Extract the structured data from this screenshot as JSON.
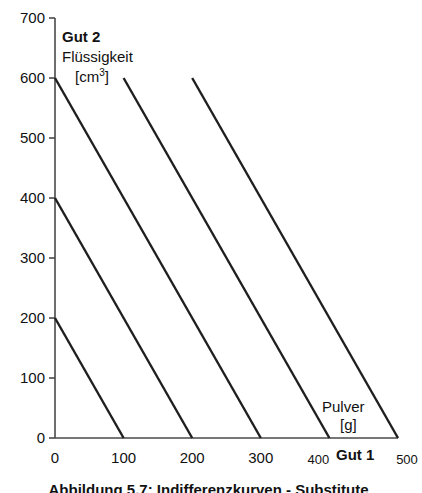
{
  "figure": {
    "background_color": "#ffffff",
    "line_color": "#1f1f1f",
    "axis_color": "#4a4a4a"
  },
  "annotations": {
    "y_axis_name": "Gut 2",
    "y_axis_quantity": "Flüssigkeit",
    "y_axis_unit_prefix": "[cm",
    "y_axis_unit_exponent": "3",
    "y_axis_unit_suffix": "]",
    "x_axis_name": "Gut 1",
    "x_axis_quantity": "Pulver",
    "x_axis_unit": "[g]"
  },
  "caption": "Abbildung 5.7: Indifferenzkurven - Substitute",
  "chart_data": {
    "type": "line",
    "title": "",
    "subtitle": "",
    "xlabel": "Gut 1 / Pulver [g]",
    "ylabel": "Gut 2 / Flüssigkeit [cm3]",
    "xlim": [
      0,
      500
    ],
    "ylim": [
      0,
      700
    ],
    "xticks": [
      0,
      100,
      200,
      300,
      400,
      500
    ],
    "yticks": [
      0,
      100,
      200,
      300,
      400,
      500,
      600,
      700
    ],
    "xtick_labels": [
      "0",
      "100",
      "200",
      "300",
      "400",
      "500"
    ],
    "ytick_labels": [
      "0",
      "100",
      "200",
      "300",
      "400",
      "500",
      "600",
      "700"
    ],
    "grid": false,
    "legend": false,
    "legend_position": "none",
    "slope": -2,
    "series": [
      {
        "name": "Indifferenzkurve 1",
        "x": [
          0,
          100
        ],
        "y": [
          200,
          0
        ]
      },
      {
        "name": "Indifferenzkurve 2",
        "x": [
          0,
          200
        ],
        "y": [
          400,
          0
        ]
      },
      {
        "name": "Indifferenzkurve 3",
        "x": [
          0,
          300
        ],
        "y": [
          600,
          0
        ]
      },
      {
        "name": "Indifferenzkurve 4",
        "x": [
          100,
          400
        ],
        "y": [
          600,
          0
        ]
      },
      {
        "name": "Indifferenzkurve 5",
        "x": [
          200,
          500
        ],
        "y": [
          600,
          0
        ]
      }
    ]
  }
}
